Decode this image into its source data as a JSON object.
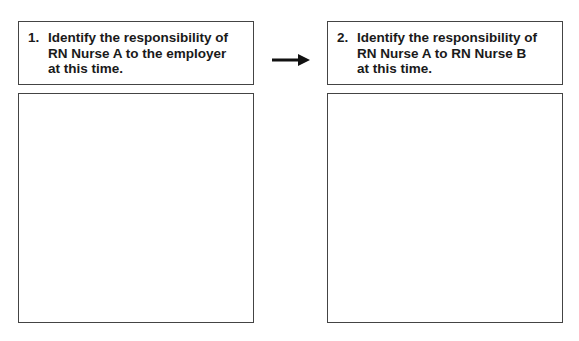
{
  "questions": [
    {
      "number": "1.",
      "text": "Identify the responsibility of RN Nurse A to the employer at this time.",
      "answer": ""
    },
    {
      "number": "2.",
      "text": "Identify the responsibility of RN Nurse A to RN Nurse B at this time.",
      "answer": ""
    }
  ],
  "connector": {
    "icon": "arrow-right-icon"
  }
}
